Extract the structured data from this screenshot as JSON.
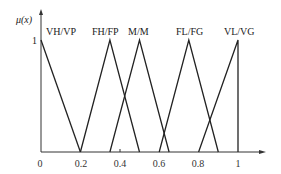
{
  "chart_data": {
    "type": "line",
    "title": "",
    "xlabel": "",
    "ylabel": "μ(x)",
    "xlim": [
      0,
      1
    ],
    "ylim": [
      0,
      1
    ],
    "grid": false,
    "x_ticks": [
      "0",
      "0.2",
      "0.4",
      "0.6",
      "0.8",
      "1"
    ],
    "y_ticks": [
      "1"
    ],
    "series": [
      {
        "name": "VH/VP",
        "x": [
          0,
          0.2
        ],
        "y": [
          1,
          0
        ]
      },
      {
        "name": "FH/FP",
        "x": [
          0.2,
          0.35,
          0.5
        ],
        "y": [
          0,
          1,
          0
        ]
      },
      {
        "name": "M/M",
        "x": [
          0.35,
          0.5,
          0.65
        ],
        "y": [
          0,
          1,
          0
        ]
      },
      {
        "name": "FL/FG",
        "x": [
          0.6,
          0.75,
          0.9
        ],
        "y": [
          0,
          1,
          0
        ]
      },
      {
        "name": "VL/VG",
        "x": [
          0.8,
          1,
          1
        ],
        "y": [
          0,
          1,
          0
        ]
      }
    ]
  },
  "labels": {
    "ylabel": "μ(x)",
    "y_one": "1",
    "series": [
      "VH/VP",
      "FH/FP",
      "M/M",
      "FL/FG",
      "VL/VG"
    ],
    "ticks": [
      "0",
      "0.2",
      "0.4",
      "0.6",
      "0.8",
      "1"
    ]
  }
}
